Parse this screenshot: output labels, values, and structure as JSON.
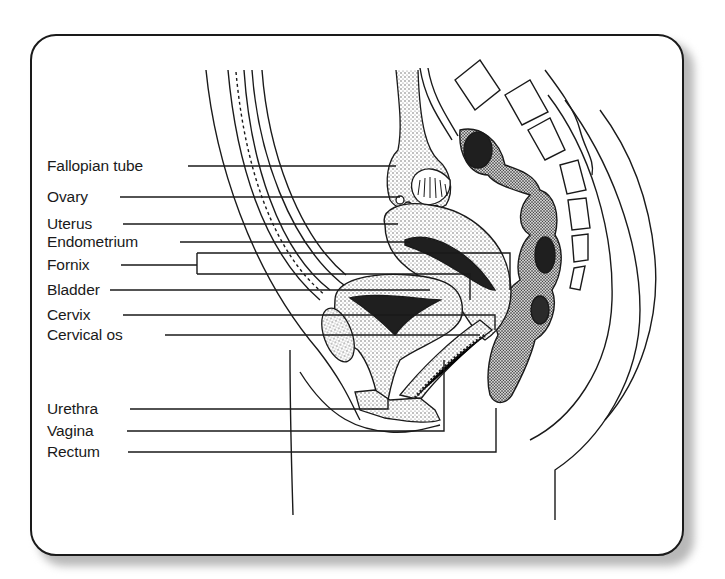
{
  "figure": {
    "labels": [
      {
        "id": "fallopian-tube",
        "text": "Fallopian tube",
        "x": 45,
        "y": 157
      },
      {
        "id": "ovary",
        "text": "Ovary",
        "x": 45,
        "y": 188
      },
      {
        "id": "uterus",
        "text": "Uterus",
        "x": 45,
        "y": 215
      },
      {
        "id": "endometrium",
        "text": "Endometrium",
        "x": 45,
        "y": 233
      },
      {
        "id": "fornix",
        "text": "Fornix",
        "x": 45,
        "y": 256
      },
      {
        "id": "bladder",
        "text": "Bladder",
        "x": 45,
        "y": 281
      },
      {
        "id": "cervix",
        "text": "Cervix",
        "x": 45,
        "y": 306
      },
      {
        "id": "cervical-os",
        "text": "Cervical os",
        "x": 45,
        "y": 326
      },
      {
        "id": "urethra",
        "text": "Urethra",
        "x": 45,
        "y": 400
      },
      {
        "id": "vagina",
        "text": "Vagina",
        "x": 45,
        "y": 422
      },
      {
        "id": "rectum",
        "text": "Rectum",
        "x": 45,
        "y": 443
      }
    ]
  },
  "colors": {
    "ink": "#1a1a1a",
    "tissue_stipple": "#8a8a8a",
    "dark_fill": "#222222",
    "background": "#ffffff"
  }
}
